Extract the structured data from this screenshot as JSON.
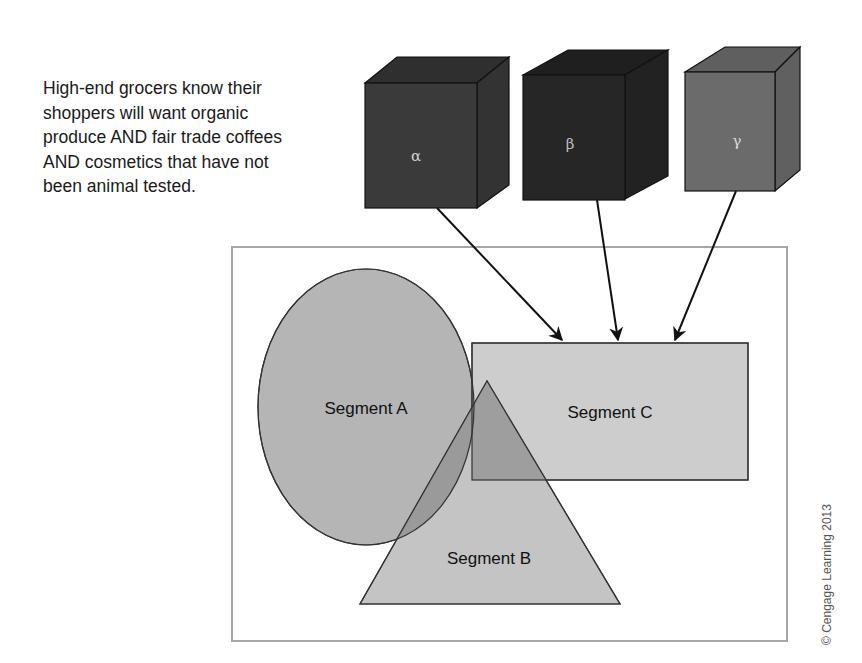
{
  "caption": {
    "lines": [
      "High-end grocers know their",
      "shoppers will want organic",
      "produce AND fair trade coffees",
      "AND cosmetics that have not",
      "been animal tested."
    ]
  },
  "cubes": [
    {
      "label": "α",
      "color": "#3a3a3a"
    },
    {
      "label": "β",
      "color": "#262626"
    },
    {
      "label": "γ",
      "color": "#6b6b6b"
    }
  ],
  "segments": {
    "a": {
      "label": "Segment A",
      "shape": "ellipse",
      "color": "#b5b5b5"
    },
    "b": {
      "label": "Segment B",
      "shape": "triangle",
      "color": "#c4c4c4"
    },
    "c": {
      "label": "Segment C",
      "shape": "rectangle",
      "color": "#cdcdcd"
    }
  },
  "overlap_color": "#9a9a9a",
  "credit": "© Cengage Learning 2013"
}
